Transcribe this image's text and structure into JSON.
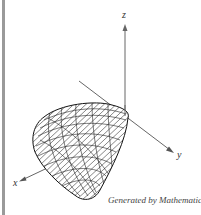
{
  "figure": {
    "axes": {
      "x_label": "x",
      "y_label": "y",
      "z_label": "z"
    },
    "credit": "Generated by Mathematica",
    "colors": {
      "frame": "#9a9a9a",
      "mesh": "#222222",
      "axis": "#555555",
      "background": "#ffffff"
    }
  }
}
